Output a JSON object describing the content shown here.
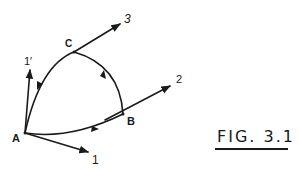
{
  "diagram": {
    "stroke_color": "#1a1a1a",
    "background": "#ffffff",
    "points": [
      {
        "id": "A",
        "label": "A",
        "x": 25,
        "y": 133
      },
      {
        "id": "B",
        "label": "B",
        "x": 123,
        "y": 114
      },
      {
        "id": "C",
        "label": "C",
        "x": 74,
        "y": 52
      }
    ],
    "vectors": [
      {
        "id": "1",
        "label": "1",
        "from": "A"
      },
      {
        "id": "1prime",
        "label": "1′",
        "from": "A"
      },
      {
        "id": "2",
        "label": "2",
        "from": "B"
      },
      {
        "id": "3",
        "label": "3",
        "from": "C"
      }
    ],
    "arcs": [
      {
        "from": "A",
        "to": "B",
        "direction": "A→B"
      },
      {
        "from": "B",
        "to": "C",
        "direction": "B→C"
      },
      {
        "from": "C",
        "to": "A",
        "direction": "C→A"
      }
    ],
    "caption": "FIG. 3.1"
  }
}
